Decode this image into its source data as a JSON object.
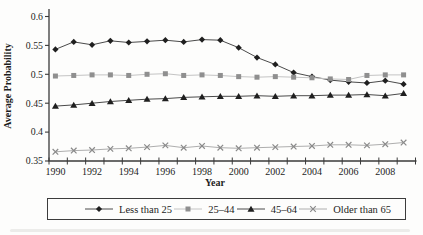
{
  "chart": {
    "y_axis_title": "Average Probability",
    "x_axis_title": "Year",
    "y_ticks": [
      "0.6",
      "0.55",
      "0.5",
      "0.45",
      "0.4",
      "0.35"
    ],
    "x_tick_labels": [
      "1990",
      "1992",
      "1994",
      "1996",
      "1998",
      "2000",
      "2002",
      "2004",
      "2006",
      "2008"
    ],
    "axis_color": "#3a3a3a",
    "tick_label_color": "#1d1d1d"
  },
  "chart_data": {
    "type": "line",
    "title": "",
    "xlabel": "Year",
    "ylabel": "Average Probability",
    "x": [
      1990,
      1991,
      1992,
      1993,
      1994,
      1995,
      1996,
      1997,
      1998,
      1999,
      2000,
      2001,
      2002,
      2003,
      2004,
      2005,
      2006,
      2007,
      2008,
      2009
    ],
    "ylim": [
      0.35,
      0.6
    ],
    "y_tick_step": 0.05,
    "grid": false,
    "legend_position": "bottom",
    "series": [
      {
        "name": "Less than 25",
        "marker": "diamond",
        "marker_color": "#1f1f1f",
        "line_color": "#4a4a4a",
        "values": [
          0.543,
          0.556,
          0.551,
          0.558,
          0.555,
          0.557,
          0.559,
          0.556,
          0.56,
          0.559,
          0.546,
          0.529,
          0.517,
          0.503,
          0.496,
          0.49,
          0.487,
          0.485,
          0.489,
          0.483
        ]
      },
      {
        "name": "25–44",
        "marker": "square",
        "marker_color": "#8f8f8f",
        "line_color": "#c4c4c4",
        "values": [
          0.497,
          0.498,
          0.499,
          0.499,
          0.498,
          0.5,
          0.501,
          0.498,
          0.499,
          0.498,
          0.496,
          0.495,
          0.496,
          0.495,
          0.494,
          0.492,
          0.491,
          0.498,
          0.499,
          0.499
        ]
      },
      {
        "name": "45–64",
        "marker": "triangle",
        "marker_color": "#1f1f1f",
        "line_color": "#4a4a4a",
        "values": [
          0.445,
          0.447,
          0.45,
          0.453,
          0.455,
          0.457,
          0.458,
          0.46,
          0.461,
          0.462,
          0.462,
          0.463,
          0.462,
          0.463,
          0.463,
          0.464,
          0.464,
          0.465,
          0.463,
          0.467
        ]
      },
      {
        "name": "Older than 65",
        "marker": "x",
        "marker_color": "#8a8a8a",
        "line_color": "#aeaeae",
        "values": [
          0.366,
          0.368,
          0.369,
          0.371,
          0.372,
          0.374,
          0.377,
          0.373,
          0.376,
          0.373,
          0.372,
          0.373,
          0.374,
          0.375,
          0.376,
          0.378,
          0.378,
          0.377,
          0.379,
          0.382
        ]
      }
    ]
  }
}
